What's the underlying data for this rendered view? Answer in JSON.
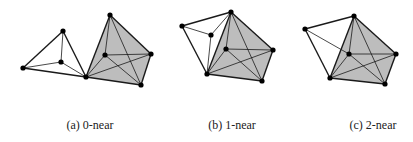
{
  "colors": {
    "edge": "#1a1a1a",
    "shade": "#bdbdbd",
    "vertex": "#000000",
    "background": "#ffffff"
  },
  "panels": [
    {
      "id": "a",
      "caption": "(a) 0-near",
      "caption_x": 90,
      "vertices": {
        "A": [
          23,
          68
        ],
        "B": [
          63,
          31
        ],
        "C": [
          61,
          62
        ],
        "D": [
          86,
          77
        ],
        "E": [
          110,
          15
        ],
        "F": [
          105,
          55
        ],
        "G": [
          151,
          54
        ],
        "H": [
          141,
          85
        ]
      },
      "shaded_polygon": [
        "D",
        "E",
        "G",
        "H"
      ],
      "thick_edges": [
        [
          "A",
          "B"
        ],
        [
          "B",
          "D"
        ],
        [
          "A",
          "D"
        ],
        [
          "D",
          "E"
        ],
        [
          "E",
          "G"
        ],
        [
          "G",
          "H"
        ],
        [
          "H",
          "D"
        ]
      ],
      "thin_edges": [
        [
          "A",
          "C"
        ],
        [
          "B",
          "C"
        ],
        [
          "C",
          "D"
        ],
        [
          "E",
          "F"
        ],
        [
          "F",
          "G"
        ],
        [
          "D",
          "F"
        ],
        [
          "D",
          "G"
        ],
        [
          "E",
          "H"
        ],
        [
          "F",
          "H"
        ]
      ]
    },
    {
      "id": "b",
      "caption": "(b) 1-near",
      "caption_x": 232,
      "vertices": {
        "A": [
          182,
          26
        ],
        "B": [
          231,
          12
        ],
        "C": [
          211,
          35
        ],
        "D": [
          207,
          74
        ],
        "E": [
          226,
          49
        ],
        "F": [
          273,
          50
        ],
        "G": [
          262,
          81
        ]
      },
      "shaded_polygon": [
        "D",
        "B",
        "F",
        "G"
      ],
      "thick_edges": [
        [
          "A",
          "B"
        ],
        [
          "A",
          "D"
        ],
        [
          "B",
          "F"
        ],
        [
          "F",
          "G"
        ],
        [
          "G",
          "D"
        ],
        [
          "D",
          "B"
        ]
      ],
      "thin_edges": [
        [
          "A",
          "C"
        ],
        [
          "C",
          "B"
        ],
        [
          "C",
          "D"
        ],
        [
          "B",
          "E"
        ],
        [
          "E",
          "F"
        ],
        [
          "D",
          "E"
        ],
        [
          "D",
          "F"
        ],
        [
          "B",
          "G"
        ],
        [
          "E",
          "G"
        ]
      ]
    },
    {
      "id": "c",
      "caption": "(c) 2-near",
      "caption_x": 373,
      "vertices": {
        "A": [
          305,
          29
        ],
        "B": [
          354,
          16
        ],
        "C": [
          349,
          54
        ],
        "D": [
          330,
          78
        ],
        "E": [
          396,
          54
        ],
        "F": [
          385,
          84
        ]
      },
      "shaded_polygon": [
        "D",
        "B",
        "E",
        "F"
      ],
      "thick_edges": [
        [
          "A",
          "B"
        ],
        [
          "A",
          "D"
        ],
        [
          "B",
          "E"
        ],
        [
          "E",
          "F"
        ],
        [
          "F",
          "D"
        ],
        [
          "D",
          "B"
        ]
      ],
      "thin_edges": [
        [
          "A",
          "C"
        ],
        [
          "B",
          "C"
        ],
        [
          "C",
          "E"
        ],
        [
          "C",
          "D"
        ],
        [
          "D",
          "E"
        ],
        [
          "B",
          "F"
        ],
        [
          "C",
          "F"
        ]
      ]
    }
  ]
}
